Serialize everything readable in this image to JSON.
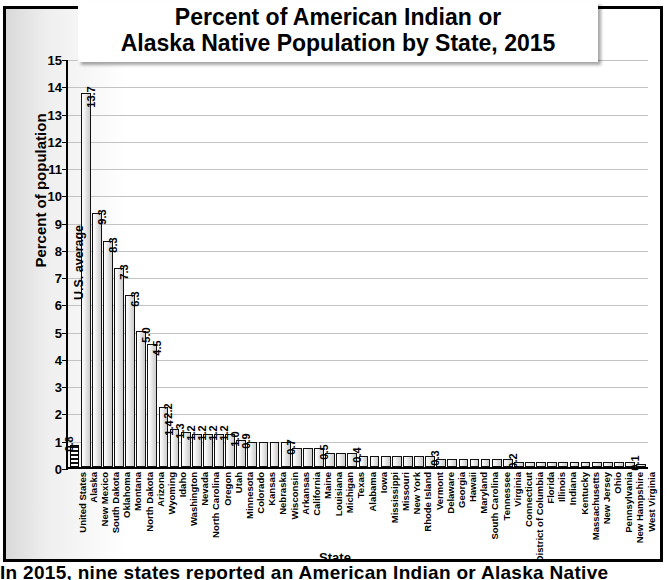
{
  "chart_data": {
    "type": "bar",
    "title": "Percent of American Indian or Alaska Native Population by State, 2015",
    "title_lines": [
      "Percent of American Indian or",
      "Alaska Native Population by State, 2015"
    ],
    "xlabel": "State",
    "ylabel": "Percent of population",
    "ylim": [
      0,
      15
    ],
    "ytick_labels": [
      "15",
      "14",
      "13",
      "12",
      "11",
      "10",
      "9",
      "8",
      "7",
      "6",
      "5",
      "4",
      "3",
      "2",
      "1",
      "0"
    ],
    "ytick_values": [
      15,
      14,
      13,
      12,
      11,
      10,
      9,
      8,
      7,
      6,
      5,
      4,
      3,
      2,
      1,
      0
    ],
    "grid": true,
    "legend_position": "none",
    "annotation": "U.S. average",
    "categories": [
      "United States",
      "Alaska",
      "New Mexico",
      "South Dakota",
      "Oklahoma",
      "Montana",
      "North Dakota",
      "Arizona",
      "Wyoming",
      "Idaho",
      "Washington",
      "Nevada",
      "North Carolina",
      "Oregon",
      "Utah",
      "Minnesota",
      "Colorado",
      "Kansas",
      "Nebraska",
      "Wisconsin",
      "Arkansas",
      "California",
      "Maine",
      "Louisiana",
      "Michigan",
      "Texas",
      "Alabama",
      "Iowa",
      "Mississippi",
      "Missouri",
      "New York",
      "Rhode Island",
      "Vermont",
      "Delaware",
      "Georgia",
      "Hawaii",
      "Maryland",
      "South Carolina",
      "Tennessee",
      "Virginia",
      "Connecticut",
      "District of Columbia",
      "Florida",
      "Illinois",
      "Indiana",
      "Kentucky",
      "Massachusetts",
      "New Jersey",
      "Ohio",
      "Pennsylvania",
      "New Hampshire",
      "West Virginia"
    ],
    "values": [
      0.8,
      13.7,
      9.3,
      8.3,
      7.3,
      6.3,
      5.0,
      4.5,
      2.2,
      1.4,
      1.3,
      1.2,
      1.2,
      1.2,
      1.2,
      1.0,
      0.9,
      0.9,
      0.9,
      0.9,
      0.7,
      0.7,
      0.7,
      0.5,
      0.5,
      0.5,
      0.4,
      0.4,
      0.4,
      0.4,
      0.4,
      0.4,
      0.4,
      0.3,
      0.3,
      0.3,
      0.3,
      0.3,
      0.3,
      0.3,
      0.2,
      0.2,
      0.2,
      0.2,
      0.2,
      0.2,
      0.2,
      0.2,
      0.2,
      0.2,
      0.2,
      0.1
    ],
    "data_labels": [
      "0.8",
      "13.7",
      "9.3",
      "8.3",
      "7.3",
      "6.3",
      "5.0",
      "4.5",
      "2.2",
      "1.4",
      "1.3",
      "1.2",
      "1.2",
      "1.2",
      "1.2",
      "1.0",
      "0.9",
      "",
      "",
      "",
      "0.7",
      "",
      "",
      "0.5",
      "",
      "",
      "0.4",
      "",
      "",
      "",
      "",
      "",
      "",
      "0.3",
      "",
      "",
      "",
      "",
      "",
      "",
      "0.2",
      "",
      "",
      "",
      "",
      "",
      "",
      "",
      "",
      "",
      "",
      "0.1"
    ]
  },
  "bottom_caption": "In 2015, nine states reported an American Indian or Alaska Native"
}
